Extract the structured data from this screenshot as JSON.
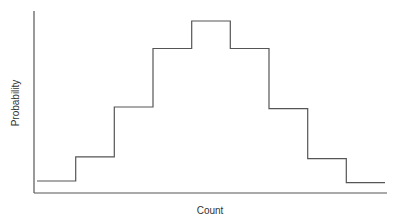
{
  "chart_data": {
    "type": "bar",
    "style": "step-histogram",
    "title": "",
    "xlabel": "Count",
    "ylabel": "Probability",
    "categories": [
      "1",
      "2",
      "3",
      "4",
      "5",
      "6",
      "7",
      "8",
      "9"
    ],
    "values": [
      0.07,
      0.21,
      0.5,
      0.84,
      1.0,
      0.84,
      0.49,
      0.2,
      0.06
    ],
    "ylim": [
      0,
      1.05
    ],
    "grid": false,
    "legend": null,
    "tick_labels_shown": false
  },
  "colors": {
    "line": "#555555",
    "axis": "#555555",
    "background": "#ffffff"
  }
}
